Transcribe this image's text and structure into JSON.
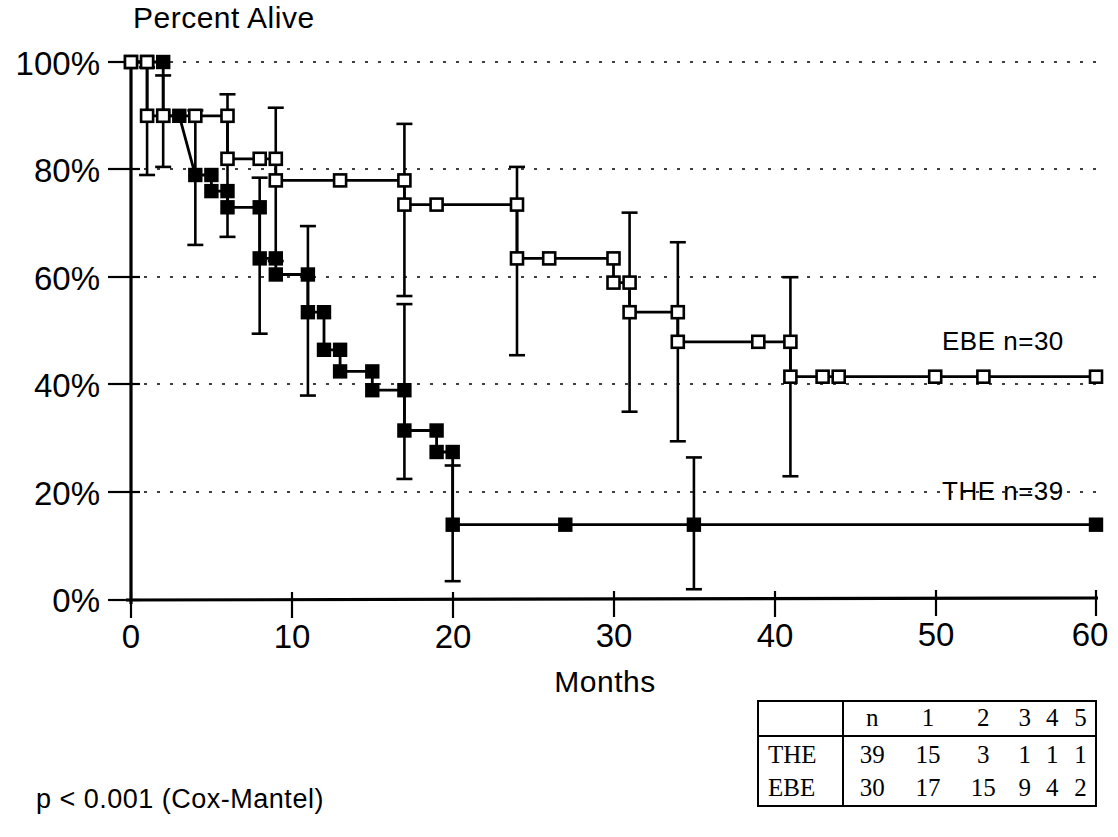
{
  "chart_data": {
    "type": "line",
    "title": "Percent Alive",
    "subtitle": "",
    "xlabel": "Months",
    "ylabel": "Percent Alive",
    "xlim": [
      0,
      60
    ],
    "ylim": [
      0,
      100
    ],
    "xticks": [
      0,
      10,
      20,
      30,
      40,
      50,
      60
    ],
    "xticklabels": [
      "0",
      "10",
      "20",
      "30",
      "40",
      "50",
      "60"
    ],
    "yticks": [
      0,
      20,
      40,
      60,
      80,
      100
    ],
    "yticklabels": [
      "0%",
      "20%",
      "40%",
      "60%",
      "80%",
      "100%"
    ],
    "grid": "horizontal-dotted",
    "legend_position": "inline-right",
    "annotations": [
      {
        "name": "p-value",
        "text": "p < 0.001 (Cox-Mantel)"
      }
    ],
    "series": [
      {
        "name": "THE",
        "label": "THE  n=39",
        "n": 39,
        "marker": "filled-square",
        "steps": [
          {
            "x": 0,
            "y": 100
          },
          {
            "x": 1,
            "y": 100
          },
          {
            "x": 2,
            "y": 100
          },
          {
            "x": 2,
            "y": 90
          },
          {
            "x": 3,
            "y": 90
          },
          {
            "x": 4,
            "y": 79
          },
          {
            "x": 5,
            "y": 79
          },
          {
            "x": 5,
            "y": 76
          },
          {
            "x": 6,
            "y": 76
          },
          {
            "x": 6,
            "y": 73
          },
          {
            "x": 8,
            "y": 73
          },
          {
            "x": 8,
            "y": 63.5
          },
          {
            "x": 9,
            "y": 63.5
          },
          {
            "x": 9,
            "y": 60.5
          },
          {
            "x": 11,
            "y": 60.5
          },
          {
            "x": 11,
            "y": 53.5
          },
          {
            "x": 12,
            "y": 53.5
          },
          {
            "x": 12,
            "y": 46.5
          },
          {
            "x": 13,
            "y": 46.5
          },
          {
            "x": 13,
            "y": 42.5
          },
          {
            "x": 15,
            "y": 42.5
          },
          {
            "x": 15,
            "y": 39
          },
          {
            "x": 17,
            "y": 39
          },
          {
            "x": 17,
            "y": 31.5
          },
          {
            "x": 19,
            "y": 31.5
          },
          {
            "x": 19,
            "y": 27.5
          },
          {
            "x": 20,
            "y": 27.5
          },
          {
            "x": 20,
            "y": 14
          },
          {
            "x": 60,
            "y": 14
          }
        ],
        "censor_marks": [
          {
            "x": 27,
            "y": 14
          },
          {
            "x": 35,
            "y": 14
          },
          {
            "x": 60,
            "y": 14
          }
        ],
        "error_bars": [
          {
            "x": 2,
            "y": 90,
            "lo": 80.5,
            "hi": 97.5
          },
          {
            "x": 4,
            "y": 79,
            "lo": 66,
            "hi": 91
          },
          {
            "x": 8,
            "y": 63.5,
            "lo": 49.5,
            "hi": 78.5
          },
          {
            "x": 11,
            "y": 53.5,
            "lo": 38,
            "hi": 69.5
          },
          {
            "x": 17,
            "y": 39,
            "lo": 22.5,
            "hi": 55
          },
          {
            "x": 20,
            "y": 14,
            "lo": 3.5,
            "hi": 25
          },
          {
            "x": 35,
            "y": 14,
            "lo": 2,
            "hi": 26.5
          }
        ]
      },
      {
        "name": "EBE",
        "label": "EBE  n=30",
        "n": 30,
        "marker": "open-square",
        "steps": [
          {
            "x": 0,
            "y": 100
          },
          {
            "x": 1,
            "y": 100
          },
          {
            "x": 1,
            "y": 90
          },
          {
            "x": 2,
            "y": 90
          },
          {
            "x": 4,
            "y": 90
          },
          {
            "x": 6,
            "y": 90
          },
          {
            "x": 6,
            "y": 82
          },
          {
            "x": 8,
            "y": 82
          },
          {
            "x": 9,
            "y": 82
          },
          {
            "x": 9,
            "y": 78
          },
          {
            "x": 13,
            "y": 78
          },
          {
            "x": 17,
            "y": 78
          },
          {
            "x": 17,
            "y": 73.5
          },
          {
            "x": 19,
            "y": 73.5
          },
          {
            "x": 24,
            "y": 73.5
          },
          {
            "x": 24,
            "y": 63.5
          },
          {
            "x": 26,
            "y": 63.5
          },
          {
            "x": 30,
            "y": 63.5
          },
          {
            "x": 30,
            "y": 59
          },
          {
            "x": 31,
            "y": 59
          },
          {
            "x": 31,
            "y": 53.5
          },
          {
            "x": 34,
            "y": 53.5
          },
          {
            "x": 34,
            "y": 48
          },
          {
            "x": 39,
            "y": 48
          },
          {
            "x": 41,
            "y": 48
          },
          {
            "x": 41,
            "y": 41.5
          },
          {
            "x": 43,
            "y": 41.5
          },
          {
            "x": 44,
            "y": 41.5
          },
          {
            "x": 50,
            "y": 41.5
          },
          {
            "x": 53,
            "y": 41.5
          },
          {
            "x": 60,
            "y": 41.5
          }
        ],
        "censor_marks": [
          {
            "x": 2,
            "y": 90
          },
          {
            "x": 4,
            "y": 90
          },
          {
            "x": 8,
            "y": 82
          },
          {
            "x": 13,
            "y": 78
          },
          {
            "x": 19,
            "y": 73.5
          },
          {
            "x": 26,
            "y": 63.5
          },
          {
            "x": 39,
            "y": 48
          },
          {
            "x": 43,
            "y": 41.5
          },
          {
            "x": 44,
            "y": 41.5
          },
          {
            "x": 50,
            "y": 41.5
          },
          {
            "x": 53,
            "y": 41.5
          },
          {
            "x": 60,
            "y": 41.5
          }
        ],
        "error_bars": [
          {
            "x": 1,
            "y": 90,
            "lo": 79,
            "hi": 99
          },
          {
            "x": 6,
            "y": 82,
            "lo": 67.5,
            "hi": 94
          },
          {
            "x": 9,
            "y": 78,
            "lo": 63,
            "hi": 91.5
          },
          {
            "x": 17,
            "y": 73.5,
            "lo": 56.5,
            "hi": 88.5
          },
          {
            "x": 24,
            "y": 63.5,
            "lo": 45.5,
            "hi": 80.5
          },
          {
            "x": 31,
            "y": 53.5,
            "lo": 35,
            "hi": 72
          },
          {
            "x": 34,
            "y": 48,
            "lo": 29.5,
            "hi": 66.5
          },
          {
            "x": 41,
            "y": 41.5,
            "lo": 23,
            "hi": 60
          }
        ]
      }
    ]
  },
  "chart": {
    "title": "Percent Alive",
    "xlabel": "Months",
    "xticklabels": [
      "0",
      "10",
      "20",
      "30",
      "40",
      "50",
      "60"
    ],
    "yticklabels": [
      "100%",
      "80%",
      "60%",
      "40%",
      "20%",
      "0%"
    ],
    "series_labels": {
      "ebe": "EBE  n=30",
      "the": "THE  n=39"
    },
    "pvalue": "p < 0.001 (Cox-Mantel)"
  },
  "risk_table": {
    "corner": "",
    "headers": [
      "n",
      "1",
      "2",
      "3",
      "4",
      "5"
    ],
    "rows": [
      {
        "label": "THE",
        "values": [
          "39",
          "15",
          "3",
          "1",
          "1",
          "1"
        ]
      },
      {
        "label": "EBE",
        "values": [
          "30",
          "17",
          "15",
          "9",
          "4",
          "2"
        ]
      }
    ]
  }
}
